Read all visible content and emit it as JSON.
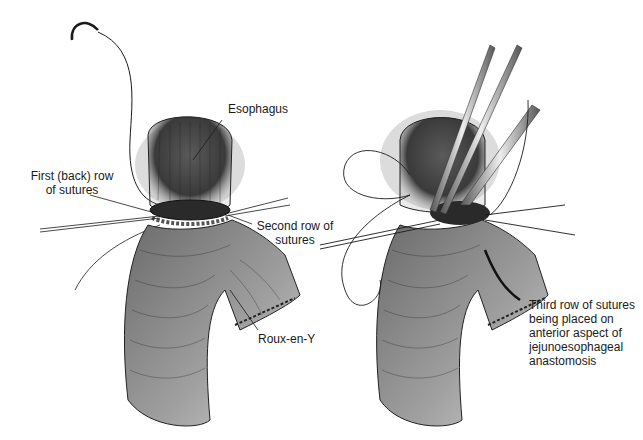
{
  "figure": {
    "left_panel": {
      "labels": {
        "esophagus": "Esophagus",
        "first_row_line1": "First (back) row",
        "first_row_line2": "of sutures",
        "second_row_line1": "Second row of",
        "second_row_line2": "sutures",
        "roux": "Roux-en-Y"
      }
    },
    "right_panel": {
      "labels": {
        "third_row_line1": "Third row of sutures",
        "third_row_line2": "being placed on",
        "third_row_line3": "anterior aspect of",
        "third_row_line4": "jejunoesophageal",
        "third_row_line5": "anastomosis"
      }
    },
    "colors": {
      "ink": "#1a1a1a",
      "tissue_dark": "#3a3a3a",
      "tissue_mid": "#7a7a7a",
      "tissue_light": "#bdbdbd",
      "background": "#ffffff"
    }
  }
}
